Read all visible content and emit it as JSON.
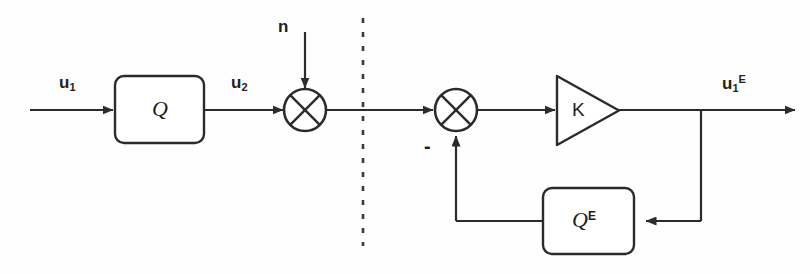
{
  "diagram": {
    "stroke_color": "#2b2b2b",
    "background_color": "#fefefe",
    "signals": {
      "input": "u",
      "input_sub": "1",
      "intermediate": "u",
      "intermediate_sub": "2",
      "noise": "n",
      "output": "u",
      "output_sub": "1",
      "output_sup": "E",
      "feedback_sign": "-"
    },
    "blocks": {
      "plant": "Q",
      "gain": "K",
      "estimator": "Q",
      "estimator_sup": "E"
    },
    "junctions": {
      "sum_noise_name": "cross-circle",
      "sum_feedback_name": "cross-circle"
    },
    "partition": {
      "style": "dashed-vertical",
      "x": 363
    }
  }
}
